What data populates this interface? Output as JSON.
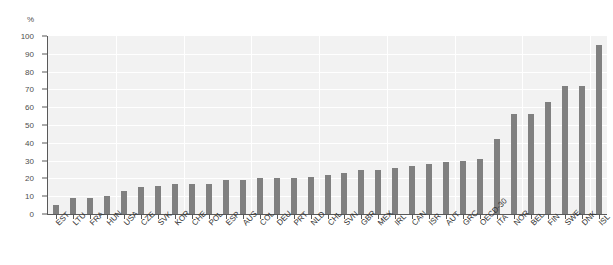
{
  "chart_data": {
    "type": "bar",
    "title": "",
    "subtitle": "",
    "xlabel": "",
    "ylabel": "",
    "unit_label": "%",
    "ylim": [
      0,
      100
    ],
    "yticks": [
      0,
      10,
      20,
      30,
      40,
      50,
      60,
      70,
      80,
      90,
      100
    ],
    "grid": true,
    "legend": false,
    "bar_color": "#808080",
    "plot_background": "#f2f2f2",
    "axis_color": "#595959",
    "categories": [
      "EST",
      "LTU",
      "FRA",
      "HUN",
      "USA",
      "CZE",
      "SVK",
      "KOR",
      "CHE",
      "POL",
      "ESP",
      "AUS",
      "COL",
      "DEU",
      "PRT",
      "NLD",
      "CHL",
      "SVN",
      "GBR",
      "MEX",
      "IRL",
      "CAN",
      "ISR",
      "AUT",
      "GRC",
      "OECD-30",
      "ITA",
      "NOR",
      "BEL",
      "FIN",
      "SWE",
      "DNK",
      "ISL"
    ],
    "values": [
      5,
      9,
      9,
      10,
      13,
      15,
      16,
      17,
      17,
      17,
      19,
      19,
      20,
      20,
      20,
      21,
      22,
      23,
      25,
      25,
      26,
      27,
      28,
      29,
      30,
      31,
      42,
      56,
      56,
      63,
      72,
      72,
      95
    ]
  }
}
